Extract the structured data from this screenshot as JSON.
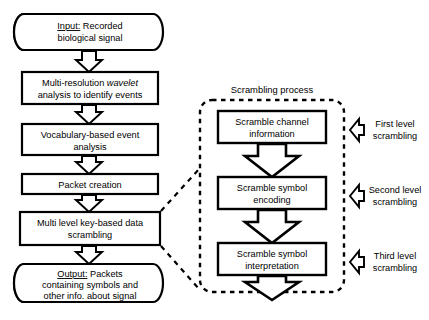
{
  "diagram": {
    "title_label": "Scrambling process",
    "colors": {
      "stroke": "#000000",
      "fill": "#ffffff",
      "text": "#000000"
    },
    "main_flow": [
      {
        "id": "input",
        "shape": "terminator",
        "prefix": "Input:",
        "line1": " Recorded",
        "line2": "biological signal"
      },
      {
        "id": "wavelet",
        "shape": "process",
        "line1a": "Multi-resolution ",
        "line1_italic": "wavelet",
        "line2": "analysis to identify events"
      },
      {
        "id": "vocabulary",
        "shape": "process",
        "line1": "Vocabulary-based event",
        "line2": "analysis"
      },
      {
        "id": "packet",
        "shape": "process",
        "line1": "Packet creation",
        "line2": ""
      },
      {
        "id": "scrambling",
        "shape": "process",
        "line1": "Multi level key-based data",
        "line2": "scrambling"
      },
      {
        "id": "output",
        "shape": "terminator",
        "prefix": "Output:",
        "line1": " Packets",
        "line2": "containing symbols and",
        "line3": "other info. about signal"
      }
    ],
    "scrambling_steps": [
      {
        "id": "channel",
        "line1": "Scramble channel",
        "line2": "information",
        "level_line1": "First level",
        "level_line2": "scrambling"
      },
      {
        "id": "encoding",
        "line1": "Scramble symbol",
        "line2": "encoding",
        "level_line1": "Second level",
        "level_line2": "scrambling"
      },
      {
        "id": "interpretation",
        "line1": "Scramble symbol",
        "line2": "interpretation",
        "level_line1": "Third level",
        "level_line2": "scrambling"
      }
    ]
  }
}
